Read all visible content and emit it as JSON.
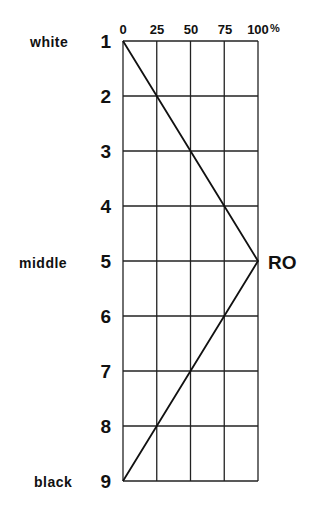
{
  "chart_data": {
    "type": "line",
    "title": "",
    "x_ticks": [
      "0",
      "25",
      "50",
      "75",
      "100 %"
    ],
    "x_values": [
      0,
      25,
      50,
      75,
      100
    ],
    "xlim": [
      0,
      100
    ],
    "xunit": "%",
    "y_ticks": [
      "1",
      "2",
      "3",
      "4",
      "5",
      "6",
      "7",
      "8",
      "9"
    ],
    "y_labels": {
      "1": "white",
      "5": "middle",
      "9": "black"
    },
    "series": [
      {
        "name": "RO",
        "points": [
          {
            "level": 1,
            "value": 0
          },
          {
            "level": 2,
            "value": 25
          },
          {
            "level": 3,
            "value": 50
          },
          {
            "level": 4,
            "value": 75
          },
          {
            "level": 5,
            "value": 100
          },
          {
            "level": 6,
            "value": 75
          },
          {
            "level": 7,
            "value": 50
          },
          {
            "level": 8,
            "value": 25
          },
          {
            "level": 9,
            "value": 0
          }
        ]
      }
    ],
    "annotation": "RO",
    "grid": true
  },
  "labels": {
    "x_ticks": [
      "0",
      "25",
      "50",
      "75",
      "100"
    ],
    "percent": "%",
    "rows": [
      "1",
      "2",
      "3",
      "4",
      "5",
      "6",
      "7",
      "8",
      "9"
    ],
    "white": "white",
    "middle": "middle",
    "black": "black",
    "ro": "RO"
  },
  "colors": {
    "line": "#111111",
    "grid": "#222222",
    "background": "#ffffff"
  }
}
